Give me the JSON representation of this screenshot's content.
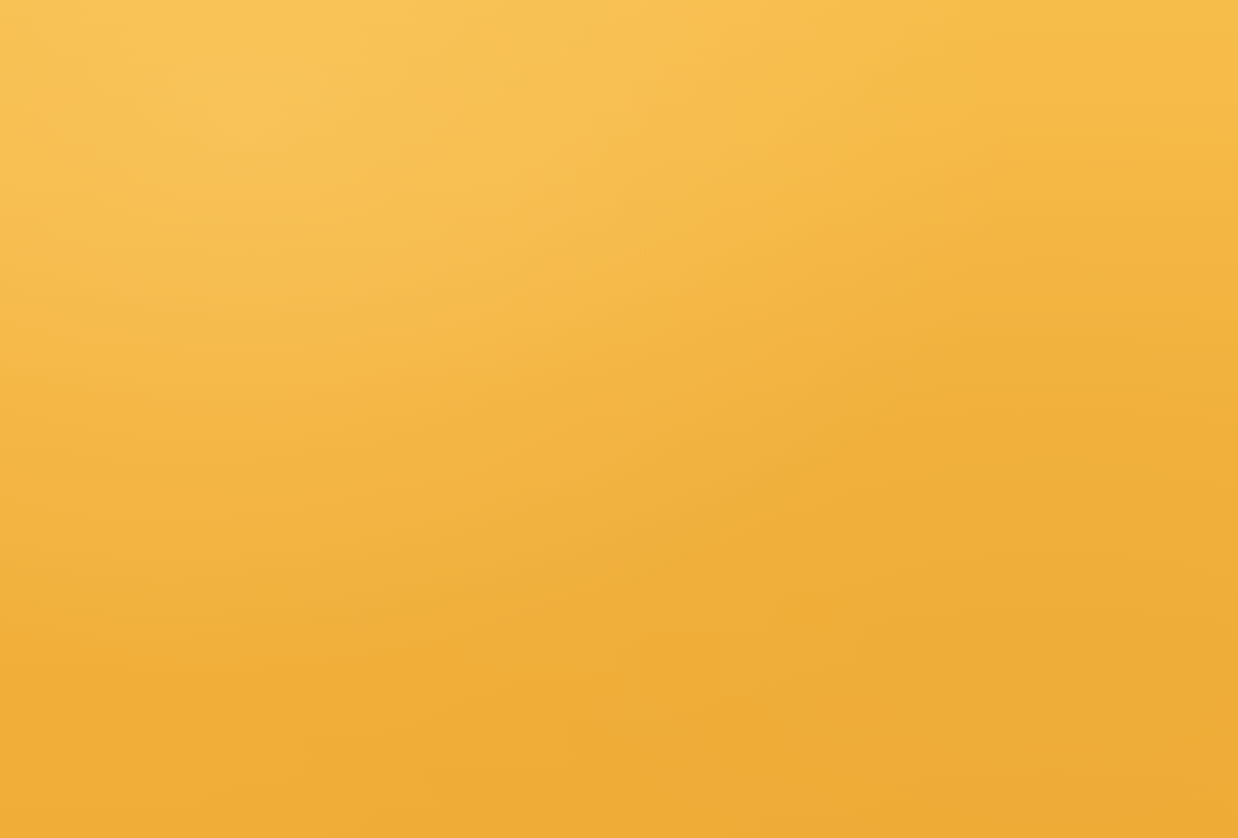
{
  "page": {
    "background_color": "#f5b942",
    "text_color": "#2d2010"
  },
  "chart_data": [
    {
      "type": "bar",
      "id": "passenger-travel",
      "title": "",
      "ylabel": "billion kms",
      "xlabel": "",
      "ylim": [
        0,
        18
      ],
      "yticks": [
        "0",
        "2",
        "4",
        "6",
        "8",
        "10",
        "12",
        "14",
        "16",
        "18"
      ],
      "ytick_values": [
        0,
        2,
        4,
        6,
        8,
        10,
        12,
        14,
        16,
        18
      ],
      "grid": false,
      "legend_position": "right",
      "categories": [
        "1976–77",
        "1986–87",
        "1996–97",
        "2003–2004"
      ],
      "series": [
        {
          "name": "Passenger cars",
          "color": "#6e4228",
          "values": [
            8.1,
            11.4,
            14.6,
            17.0
          ]
        },
        {
          "name": "Light commercial vehicles",
          "color": "#7a4a2b",
          "values": [
            0.6,
            0.85,
            1.1,
            1.35
          ]
        },
        {
          "name": "Motorcycles",
          "color": "#a85c34",
          "values": [
            0.08,
            0.1,
            0.06,
            0.05
          ]
        },
        {
          "name": "Rail",
          "color": "#c8924f",
          "values": [
            0.05,
            0.1,
            0.55,
            0.6
          ]
        },
        {
          "name": "Bus",
          "color": "#dcb173",
          "values": [
            0.45,
            0.65,
            0.95,
            1.05
          ]
        }
      ]
    },
    {
      "type": "bar",
      "id": "air-emissions",
      "stacked": true,
      "title": "",
      "ylabel": "tonnes",
      "xlabel": "",
      "ylim": [
        0,
        300000
      ],
      "yticks": [
        "0",
        "50,000",
        "100,000",
        "150,000",
        "200,000",
        "250,000",
        "300,000"
      ],
      "ytick_values": [
        0,
        50000,
        100000,
        150000,
        200000,
        250000,
        300000
      ],
      "grid": false,
      "legend_position": "right",
      "categories": [
        "Motor vehicles",
        "Industry",
        "Area based"
      ],
      "series": [
        {
          "name": "Oxides of nitrogen",
          "color": "#c2663c",
          "values": [
            24000,
            23000,
            0
          ]
        },
        {
          "name": "Reactive Organic Compounds (ROC)",
          "color": "#d8a860",
          "values": [
            27000,
            8000,
            30000
          ]
        },
        {
          "name": "Carbon monoxide",
          "color": "#7e4a2e",
          "values": [
            215000,
            8000,
            45000
          ]
        }
      ]
    }
  ],
  "top_chart": {
    "unit_label": "billion kms",
    "yticks": [
      "18",
      "16",
      "14",
      "12",
      "10",
      "8",
      "6",
      "4",
      "2",
      "0"
    ],
    "xlabels": [
      "1976–77",
      "1986–87",
      "1996–97",
      "2003–2004"
    ],
    "legend": [
      {
        "label": "Passenger cars",
        "color": "#6e4228"
      },
      {
        "label": "Light commercial vehicles",
        "color": "#7a4a2b"
      },
      {
        "label": "Motorcycles",
        "color": "#a85c34"
      },
      {
        "label": "Rail",
        "color": "#c8924f"
      },
      {
        "label": "Bus",
        "color": "#dcb173"
      }
    ]
  },
  "bottom_chart": {
    "unit_label": "tonnes",
    "yticks": [
      "300,000",
      "250,000",
      "200,000",
      "150,000",
      "100,000",
      "50,000",
      "0"
    ],
    "xlabels": [
      "Motor vehicles",
      "Industry",
      "Area based"
    ],
    "legend": [
      {
        "label": "Carbon monoxide",
        "color": "#7e4a2e"
      },
      {
        "label": "Reactive Organic Compounds (ROC)",
        "color": "#d8a860"
      },
      {
        "label": "Oxides of nitrogen",
        "color": "#c2663c"
      }
    ]
  }
}
